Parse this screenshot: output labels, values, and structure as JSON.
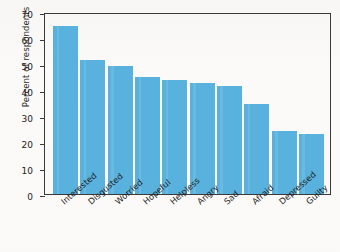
{
  "chart_data": {
    "type": "bar",
    "title": "",
    "xlabel": "",
    "ylabel": "Percent of respondents",
    "ylim": [
      0,
      70
    ],
    "yticks": [
      0,
      10,
      20,
      30,
      40,
      50,
      60,
      70
    ],
    "grid": false,
    "legend": false,
    "bar_color": "#59b1dd",
    "axis_color": "#3a3a3a",
    "categories": [
      "Interested",
      "Disgusted",
      "Worried",
      "Hopeful",
      "Helpless",
      "Angry",
      "Sad",
      "Afraid",
      "Depressed",
      "Guilty"
    ],
    "values": [
      64.5,
      51.4,
      49.2,
      45.0,
      43.8,
      42.6,
      41.5,
      34.5,
      24.3,
      23.1
    ]
  }
}
